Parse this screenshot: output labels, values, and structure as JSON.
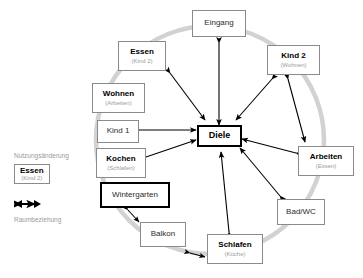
{
  "diagram": {
    "colors": {
      "circle": "#d2d2d2",
      "arrow": "#000000",
      "node_border": "#8a8a8a",
      "node_border_strong": "#000000",
      "primary_text": "#000000",
      "secondary_text": "#9a9a9a"
    },
    "center_node": {
      "label": "Diele",
      "sub": ""
    },
    "nodes": [
      {
        "id": "eingang",
        "label": "Eingang",
        "sub": "",
        "bold": false,
        "strong": false
      },
      {
        "id": "kind2",
        "label": "Kind 2",
        "sub": "(Wohnen)",
        "bold": true,
        "strong": false
      },
      {
        "id": "arbeiten",
        "label": "Arbeiten",
        "sub": "(Essen)",
        "bold": true,
        "strong": false
      },
      {
        "id": "badwc",
        "label": "Bad/WC",
        "sub": "",
        "bold": false,
        "strong": false
      },
      {
        "id": "schlafen",
        "label": "Schlafen",
        "sub": "(Küche)",
        "bold": true,
        "strong": false
      },
      {
        "id": "balkon",
        "label": "Balkon",
        "sub": "",
        "bold": false,
        "strong": false
      },
      {
        "id": "wintergarten",
        "label": "Wintergarten",
        "sub": "",
        "bold": false,
        "strong": true
      },
      {
        "id": "kochen",
        "label": "Kochen",
        "sub": "(Schlafen)",
        "bold": true,
        "strong": false
      },
      {
        "id": "kind1",
        "label": "Kind 1",
        "sub": "",
        "bold": false,
        "strong": false
      },
      {
        "id": "wohnen",
        "label": "Wohnen",
        "sub": "(Arbeiten)",
        "bold": true,
        "strong": false
      },
      {
        "id": "essen",
        "label": "Essen",
        "sub": "(Kind 2)",
        "bold": true,
        "strong": false
      }
    ],
    "legend": {
      "usage_change_caption": "Nutzungsänderung",
      "usage_change_example": {
        "label": "Essen",
        "sub": "(Kind 2)"
      },
      "relation_caption": "Raumbeziehung"
    }
  }
}
